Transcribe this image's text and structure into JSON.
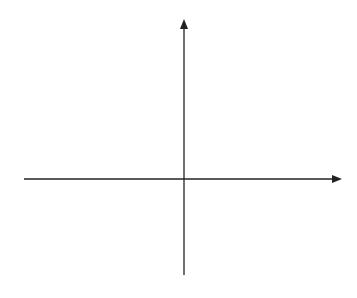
{
  "chart_data": {
    "type": "line",
    "title": "",
    "xlabel": "x",
    "ylabel": "y",
    "xlim": [
      -5,
      5
    ],
    "ylim": [
      -3,
      5
    ],
    "grid": true,
    "grid_step": 1,
    "x_tick_labels": [
      {
        "value": 0,
        "label": "0"
      },
      {
        "value": 2,
        "label": "2"
      }
    ],
    "y_tick_labels": [
      {
        "value": 2,
        "label": "2"
      }
    ],
    "series": [
      {
        "name": "f",
        "points": [
          [
            -4,
            -2
          ],
          [
            -3.3,
            -1.5
          ],
          [
            -3,
            -1
          ],
          [
            -2,
            1
          ],
          [
            -1,
            2.5
          ],
          [
            0,
            3
          ],
          [
            1,
            2.7
          ],
          [
            2,
            2
          ],
          [
            3,
            0.8
          ],
          [
            4,
            -1
          ]
        ]
      },
      {
        "name": "g",
        "points": [
          [
            -4,
            2.5
          ],
          [
            -3,
            2
          ],
          [
            -2,
            1
          ],
          [
            -1,
            0.6
          ],
          [
            0,
            0.5
          ],
          [
            1,
            1
          ],
          [
            2,
            2
          ],
          [
            2.5,
            2.9
          ],
          [
            3,
            4
          ]
        ]
      }
    ],
    "annotations": [
      {
        "text": "f",
        "x": -1.6,
        "y": 2.5
      },
      {
        "text": "g",
        "x": 2.3,
        "y": 3.4
      }
    ]
  },
  "labels": {
    "x_axis": "x",
    "y_axis": "y",
    "origin": "0",
    "x_tick_2": "2",
    "y_tick_2": "2",
    "f_label": "f",
    "g_label": "g"
  },
  "colors": {
    "grid": "#7a7a7a",
    "axis": "#222222",
    "curve": "#6a6a6a",
    "text": "#333333"
  }
}
